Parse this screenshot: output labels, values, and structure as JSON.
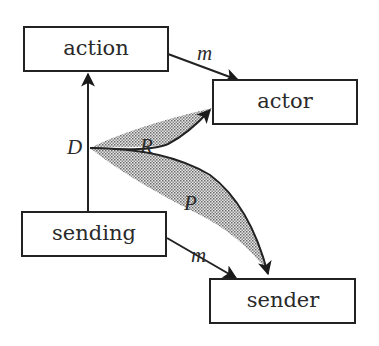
{
  "diagram": {
    "nodes": {
      "action": {
        "label": "action"
      },
      "actor": {
        "label": "actor"
      },
      "sending": {
        "label": "sending"
      },
      "sender": {
        "label": "sender"
      }
    },
    "edges": {
      "action_to_actor": {
        "label": "m"
      },
      "sending_to_sender": {
        "label": "m"
      },
      "sending_to_action": {
        "label": ""
      },
      "d_to_actor": {
        "label": "R"
      },
      "d_to_sender": {
        "label": "P"
      }
    },
    "anchor": {
      "label": "D"
    },
    "colors": {
      "stroke": "#222222",
      "fill_shade": "#b8b8b8",
      "background": "#ffffff"
    }
  }
}
